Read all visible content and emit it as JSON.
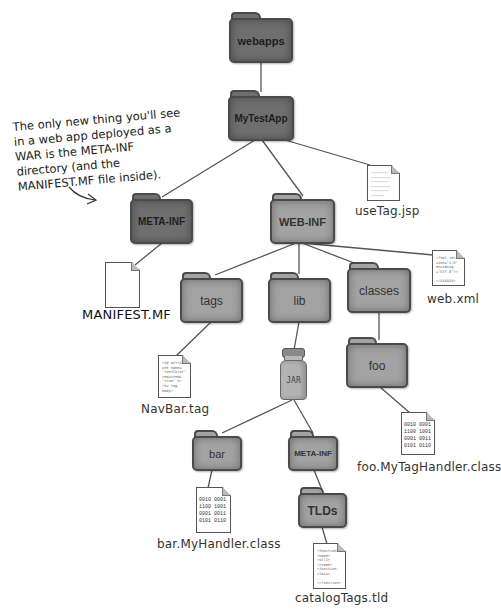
{
  "annotation": {
    "text": "The only new thing you'll see in a web app deployed as a WAR is the META-INF directory (and the MANIFEST.MF file inside)."
  },
  "colors": {
    "dark_folder": "#6f6f6f",
    "light_folder": "#a3a3a3",
    "line": "#555555",
    "text": "#222222"
  },
  "folders": {
    "webapps": "webapps",
    "mytestapp": "MyTestApp",
    "meta_inf_root": "META-INF",
    "web_inf": "WEB-INF",
    "tags": "tags",
    "lib": "lib",
    "classes": "classes",
    "foo": "foo",
    "bar": "bar",
    "meta_inf_jar": "META-INF",
    "tlds": "TLDs"
  },
  "jar": {
    "label": "JAR"
  },
  "files": {
    "usetag_jsp": "useTag.jsp",
    "manifest_mf": "MANIFEST.MF",
    "web_xml": "web.xml",
    "navbar_tag": "NavBar.tag",
    "foo_class": "foo.MyTagHandler.class",
    "bar_class": "bar.MyHandler.class",
    "catalog_tld": "catalogTags.tld"
  },
  "file_contents": {
    "binary": "0010 0001\n1100 1001\n0001 0011\n0101 0110",
    "web_xml": "<?xml ver\nsion=\"1.0\"\nencoding\n=\"UTF-8\"?>\n\n</XXXXXX>",
    "navbar_tag": "<%@ attrib\nute name=\n\"fontColor\"\nrequired=\n\"true\" %>\n<%= tag\nbody>",
    "catalog_tld": "<function>\n<name>\nrollIt\n</name>\n<function-\nclass>\n...\n</function>",
    "usetag_jsp": "~~~~~~~~\n~~~~~~~~~\n~~~~~~~~\n~~~~~~~~~\n~~~~~~~~\n~~~~~~\n~~~~"
  },
  "edges": [
    [
      "webapps",
      "MyTestApp"
    ],
    [
      "MyTestApp",
      "META-INF"
    ],
    [
      "MyTestApp",
      "WEB-INF"
    ],
    [
      "MyTestApp",
      "useTag.jsp"
    ],
    [
      "META-INF",
      "MANIFEST.MF"
    ],
    [
      "WEB-INF",
      "tags"
    ],
    [
      "WEB-INF",
      "lib"
    ],
    [
      "WEB-INF",
      "classes"
    ],
    [
      "WEB-INF",
      "web.xml"
    ],
    [
      "tags",
      "NavBar.tag"
    ],
    [
      "lib",
      "JAR"
    ],
    [
      "classes",
      "foo"
    ],
    [
      "foo",
      "foo.MyTagHandler.class"
    ],
    [
      "JAR",
      "bar"
    ],
    [
      "JAR",
      "META-INF"
    ],
    [
      "bar",
      "bar.MyHandler.class"
    ],
    [
      "META-INF",
      "TLDs"
    ],
    [
      "TLDs",
      "catalogTags.tld"
    ]
  ]
}
